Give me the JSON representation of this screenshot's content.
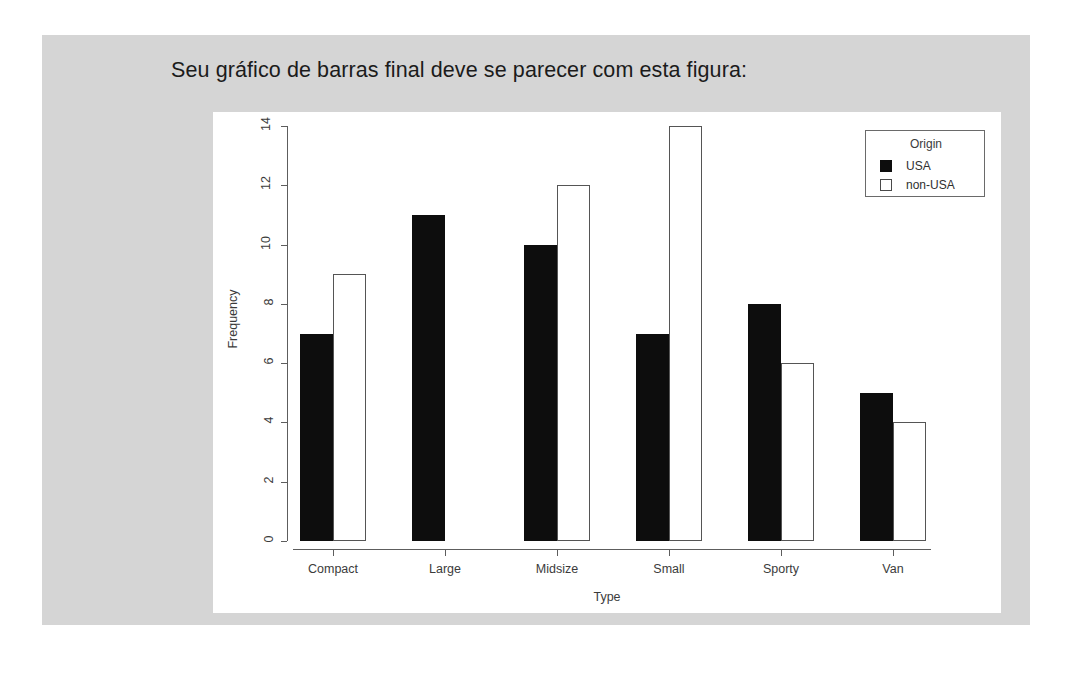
{
  "slide": {
    "title": "Seu gráfico de barras final deve se parecer com esta figura:",
    "panel_color": "#d5d5d5",
    "canvas_color": "#ffffff"
  },
  "chart_data": {
    "type": "bar",
    "title": "",
    "xlabel": "Type",
    "ylabel": "Frequency",
    "categories": [
      "Compact",
      "Large",
      "Midsize",
      "Small",
      "Sporty",
      "Van"
    ],
    "series": [
      {
        "name": "USA",
        "values": [
          7,
          11,
          10,
          7,
          8,
          5
        ],
        "color": "#0d0d0d",
        "style": "filled"
      },
      {
        "name": "non-USA",
        "values": [
          9,
          0,
          12,
          14,
          6,
          4
        ],
        "color": "#ffffff",
        "style": "outlined"
      }
    ],
    "ylim": [
      0,
      14
    ],
    "yticks": [
      0,
      2,
      4,
      6,
      8,
      10,
      12,
      14
    ],
    "ytick_labels": [
      "0",
      "2",
      "4",
      "6",
      "8",
      "10",
      "12",
      "14"
    ],
    "grid": false,
    "beside": true,
    "legend": {
      "title": "Origin",
      "position": "top-right",
      "entries": [
        "USA",
        "non-USA"
      ]
    }
  }
}
